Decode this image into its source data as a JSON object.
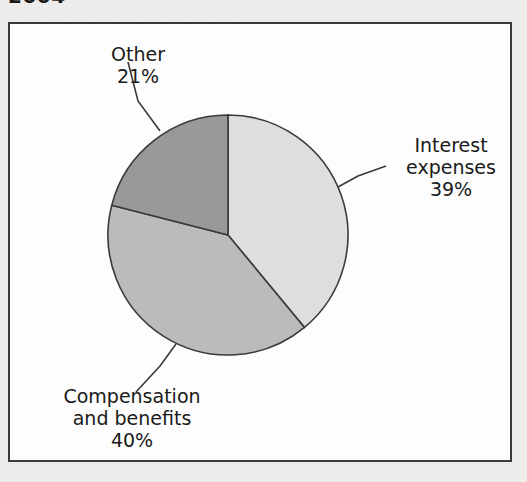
{
  "caption": "2004",
  "chart_data": {
    "type": "pie",
    "title": "2004",
    "categories": [
      "Interest expenses",
      "Compensation and benefits",
      "Other"
    ],
    "values": [
      39,
      40,
      21
    ],
    "unit": "%",
    "start_angle_deg": 0,
    "direction": "clockwise",
    "legend": "none",
    "grid": false,
    "colors": [
      "#dedede",
      "#bbbbbb",
      "#999999"
    ],
    "slice_border_color": "#3a3a3a",
    "labels": [
      {
        "name": "Interest expenses",
        "lines": [
          "Interest",
          "expenses"
        ],
        "value_text": "39%",
        "value": 39,
        "color": "#dedede"
      },
      {
        "name": "Compensation and benefits",
        "lines": [
          "Compensation",
          "and benefits"
        ],
        "value_text": "40%",
        "value": 40,
        "color": "#bbbbbb"
      },
      {
        "name": "Other",
        "lines": [
          "Other"
        ],
        "value_text": "21%",
        "value": 21,
        "color": "#999999"
      }
    ]
  },
  "labels": {
    "other": {
      "line1": "Other",
      "value": "21%"
    },
    "interest": {
      "line1": "Interest",
      "line2": "expenses",
      "value": "39%"
    },
    "compensation": {
      "line1": "Compensation",
      "line2": "and benefits",
      "value": "40%"
    }
  },
  "geometry": {
    "center_x": 228,
    "center_y": 235,
    "radius": 120
  }
}
